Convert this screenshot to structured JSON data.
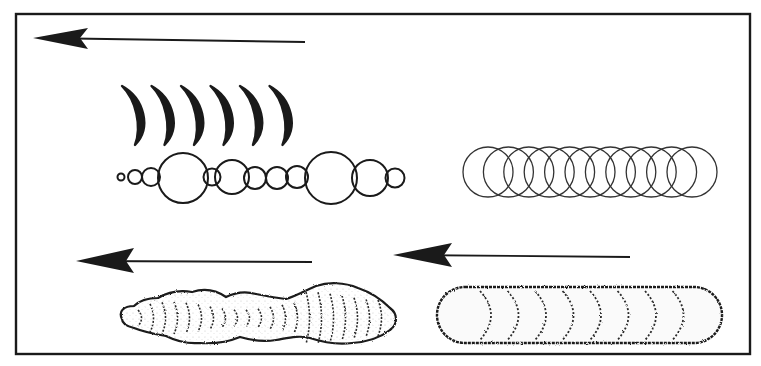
{
  "figure": {
    "ink_color": "#1a1a1a",
    "background_color": "#ffffff",
    "panels": [
      {
        "id": "top-left",
        "arrow_direction": "left",
        "pattern": "crescent-marks-and-irregular-circles",
        "crescent_count": 6,
        "circle_chain_count": 13
      },
      {
        "id": "top-right",
        "pattern": "regular-overlapping-circles",
        "circle_count": 11
      },
      {
        "id": "bottom-left",
        "arrow_direction": "left",
        "pattern": "stippled-bulging-blob"
      },
      {
        "id": "bottom-right",
        "arrow_direction": "left",
        "pattern": "stippled-capsule-with-crescent-bands",
        "band_count": 8
      }
    ]
  }
}
